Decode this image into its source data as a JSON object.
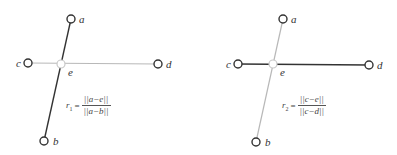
{
  "colors": {
    "dark": "#333333",
    "light": "#b8b8b8",
    "node_fill": "#ffffff"
  },
  "panels": [
    {
      "id": "left",
      "highlighted_segment": "a-b",
      "points": {
        "a": {
          "label": "a",
          "x": 71,
          "y": 19
        },
        "b": {
          "label": "b",
          "x": 44,
          "y": 141
        },
        "c": {
          "label": "c",
          "x": 28,
          "y": 63
        },
        "d": {
          "label": "d",
          "x": 158,
          "y": 64
        },
        "e": {
          "label": "e",
          "x": 61,
          "y": 64
        }
      },
      "formula": {
        "lhs": "r",
        "sub": "1",
        "eq": "=",
        "numerator": "||a−e||",
        "denominator": "||a−b||"
      }
    },
    {
      "id": "right",
      "highlighted_segment": "c-d",
      "points": {
        "a": {
          "label": "a",
          "x": 283,
          "y": 19
        },
        "b": {
          "label": "b",
          "x": 256,
          "y": 142
        },
        "c": {
          "label": "c",
          "x": 238,
          "y": 64
        },
        "d": {
          "label": "d",
          "x": 369,
          "y": 65
        },
        "e": {
          "label": "e",
          "x": 273,
          "y": 64
        }
      },
      "formula": {
        "lhs": "r",
        "sub": "2",
        "eq": "=",
        "numerator": "||c−e||",
        "denominator": "||c−d||"
      }
    }
  ]
}
